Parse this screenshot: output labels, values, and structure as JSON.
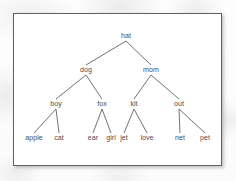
{
  "figure": {
    "kind": "binary-tree-diagram",
    "frame": {
      "border_color": "#5d5f61",
      "background_color": "#ffffff"
    },
    "style": {
      "edge_color": "#57585a",
      "label_color": "#4c4d4f",
      "page_background": "#fbfbfb"
    }
  },
  "tree": {
    "root": "hat",
    "levels": [
      {
        "index": 0,
        "labels": [
          "hat"
        ]
      },
      {
        "index": 1,
        "labels": [
          "dog",
          "mom"
        ]
      },
      {
        "index": 2,
        "labels": [
          "boy",
          "fox",
          "kit",
          "out"
        ]
      },
      {
        "index": 3,
        "labels": [
          "apple",
          "cat",
          "ear",
          "girl",
          "jet",
          "love",
          "net",
          "pet"
        ]
      }
    ],
    "nodes": [
      {
        "id": "hat",
        "label": "hat",
        "level": 0,
        "x": 112,
        "y": 24,
        "parent": null,
        "side": null
      },
      {
        "id": "dog",
        "label": "dog",
        "level": 1,
        "x": 72,
        "y": 58,
        "parent": "hat",
        "side": "left"
      },
      {
        "id": "mom",
        "label": "mom",
        "level": 1,
        "x": 137,
        "y": 58,
        "parent": "hat",
        "side": "right"
      },
      {
        "id": "boy",
        "label": "boy",
        "level": 2,
        "x": 42,
        "y": 92,
        "parent": "dog",
        "side": "left"
      },
      {
        "id": "fox",
        "label": "fox",
        "level": 2,
        "x": 88,
        "y": 92,
        "parent": "dog",
        "side": "right"
      },
      {
        "id": "kit",
        "label": "kit",
        "level": 2,
        "x": 120,
        "y": 92,
        "parent": "mom",
        "side": "left"
      },
      {
        "id": "out",
        "label": "out",
        "level": 2,
        "x": 165,
        "y": 92,
        "parent": "mom",
        "side": "right"
      },
      {
        "id": "apple",
        "label": "apple",
        "level": 3,
        "x": 20,
        "y": 126,
        "parent": "boy",
        "side": "left"
      },
      {
        "id": "cat",
        "label": "cat",
        "level": 3,
        "x": 45,
        "y": 126,
        "parent": "boy",
        "side": "right"
      },
      {
        "id": "ear",
        "label": "ear",
        "level": 3,
        "x": 79,
        "y": 126,
        "parent": "fox",
        "side": "left"
      },
      {
        "id": "girl",
        "label": "girl",
        "level": 3,
        "x": 97,
        "y": 126,
        "parent": "fox",
        "side": "right"
      },
      {
        "id": "jet",
        "label": "jet",
        "level": 3,
        "x": 110,
        "y": 126,
        "parent": "kit",
        "side": "left"
      },
      {
        "id": "love",
        "label": "love",
        "level": 3,
        "x": 133,
        "y": 126,
        "parent": "kit",
        "side": "right"
      },
      {
        "id": "net",
        "label": "net",
        "level": 3,
        "x": 166,
        "y": 126,
        "parent": "out",
        "side": "left"
      },
      {
        "id": "pet",
        "label": "pet",
        "level": 3,
        "x": 191,
        "y": 126,
        "parent": "out",
        "side": "right"
      }
    ],
    "edges": [
      {
        "from": "hat",
        "to": "dog"
      },
      {
        "from": "hat",
        "to": "mom"
      },
      {
        "from": "dog",
        "to": "boy"
      },
      {
        "from": "dog",
        "to": "fox"
      },
      {
        "from": "mom",
        "to": "kit"
      },
      {
        "from": "mom",
        "to": "out"
      },
      {
        "from": "boy",
        "to": "apple"
      },
      {
        "from": "boy",
        "to": "cat"
      },
      {
        "from": "fox",
        "to": "ear"
      },
      {
        "from": "fox",
        "to": "girl"
      },
      {
        "from": "kit",
        "to": "jet"
      },
      {
        "from": "kit",
        "to": "love"
      },
      {
        "from": "out",
        "to": "net"
      },
      {
        "from": "out",
        "to": "pet"
      }
    ]
  }
}
